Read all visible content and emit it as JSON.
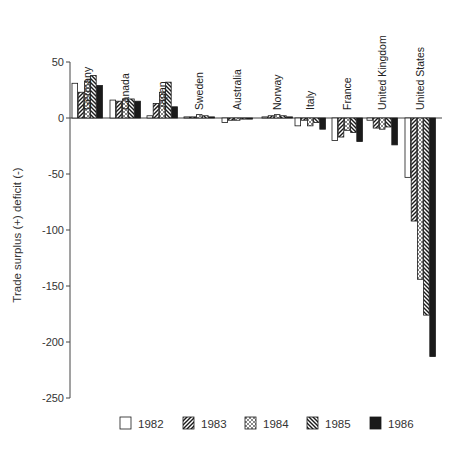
{
  "chart_data": {
    "type": "bar",
    "title": "",
    "xlabel": "",
    "ylabel": "Trade surplus (+) deficit (-)",
    "ylim": [
      -250,
      50
    ],
    "yticks": [
      50,
      0,
      -50,
      -100,
      -150,
      -200,
      -250
    ],
    "grid": false,
    "legend_position": "bottom",
    "categories": [
      "Germany",
      "Canada",
      "Japan",
      "Sweden",
      "Australia",
      "Norway",
      "Italy",
      "France",
      "United Kingdom",
      "United States"
    ],
    "series": [
      {
        "name": "1982",
        "pattern": "open",
        "values": [
          31,
          16,
          2,
          1,
          -4,
          1,
          -7,
          -20,
          -2,
          -53
        ]
      },
      {
        "name": "1983",
        "pattern": "diagonal-forward",
        "values": [
          23,
          15,
          13,
          1,
          -2,
          2,
          -2,
          -17,
          -9,
          -92
        ]
      },
      {
        "name": "1984",
        "pattern": "crosshatch",
        "values": [
          33,
          17,
          23,
          3,
          -2,
          3,
          -7,
          -11,
          -10,
          -144
        ]
      },
      {
        "name": "1985",
        "pattern": "diagonal-back",
        "values": [
          38,
          17,
          32,
          2,
          -1,
          2,
          -4,
          -13,
          -8,
          -176
        ]
      },
      {
        "name": "1986",
        "pattern": "solid-black",
        "values": [
          29,
          15,
          10,
          1,
          -1,
          1,
          -10,
          -21,
          -24,
          -213
        ]
      }
    ]
  },
  "legend": [
    {
      "label": "1982",
      "pattern": "open"
    },
    {
      "label": "1983",
      "pattern": "diagonal-forward"
    },
    {
      "label": "1984",
      "pattern": "crosshatch"
    },
    {
      "label": "1985",
      "pattern": "diagonal-back"
    },
    {
      "label": "1986",
      "pattern": "solid-black"
    }
  ],
  "colors": {
    "ink": "#1a1a1a",
    "axis": "#444444",
    "background": "#ffffff"
  }
}
